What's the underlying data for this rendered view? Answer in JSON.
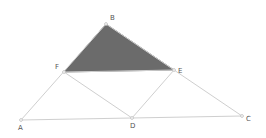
{
  "diagram": {
    "title": "",
    "colors": {
      "line": "#cfcfcf",
      "shade": "#6b6b6b",
      "shade_stroke": "#5a5a5a",
      "point": "#bdbdbd",
      "label": "#555555"
    },
    "points": [
      {
        "id": "A",
        "label": "A",
        "x": 21,
        "y": 120,
        "lx": 18,
        "ly": 130
      },
      {
        "id": "B",
        "label": "B",
        "x": 106,
        "y": 24,
        "lx": 110,
        "ly": 20
      },
      {
        "id": "C",
        "label": "C",
        "x": 242,
        "y": 116,
        "lx": 246,
        "ly": 121
      },
      {
        "id": "D",
        "label": "D",
        "x": 132,
        "y": 118,
        "lx": 130,
        "ly": 128
      },
      {
        "id": "E",
        "label": "E",
        "x": 174,
        "y": 70,
        "lx": 178,
        "ly": 73
      },
      {
        "id": "F",
        "label": "F",
        "x": 64,
        "y": 72,
        "lx": 55,
        "ly": 69
      }
    ],
    "segments": [
      [
        "A",
        "B"
      ],
      [
        "B",
        "C"
      ],
      [
        "A",
        "C"
      ],
      [
        "F",
        "E"
      ],
      [
        "F",
        "D"
      ],
      [
        "D",
        "E"
      ]
    ],
    "shaded_polygon": [
      "B",
      "F",
      "E"
    ]
  }
}
